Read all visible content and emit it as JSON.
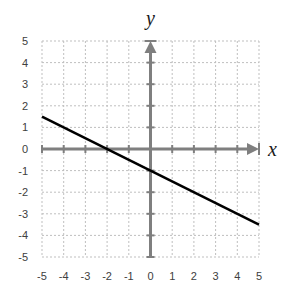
{
  "chart_data": {
    "type": "line",
    "title": "",
    "xlabel": "x",
    "ylabel": "y",
    "xlim": [
      -5,
      5
    ],
    "ylim": [
      -5,
      5
    ],
    "grid": true,
    "x_ticks": [
      -5,
      -4,
      -3,
      -2,
      -1,
      0,
      1,
      2,
      3,
      4,
      5
    ],
    "y_ticks": [
      5,
      4,
      3,
      2,
      1,
      0,
      -1,
      -2,
      -3,
      -4,
      -5
    ],
    "series": [
      {
        "name": "y = -0.5x - 1",
        "x": [
          -5,
          5
        ],
        "y": [
          1.5,
          -3.5
        ],
        "color": "#000000"
      }
    ],
    "annotations": {
      "x_intercept": [
        -2,
        0
      ],
      "y_intercept": [
        0,
        -1
      ]
    }
  },
  "colors": {
    "axis": "#7f7f7f",
    "grid": "#bfbfbf",
    "line": "#000000",
    "tick_text": "#404040"
  }
}
